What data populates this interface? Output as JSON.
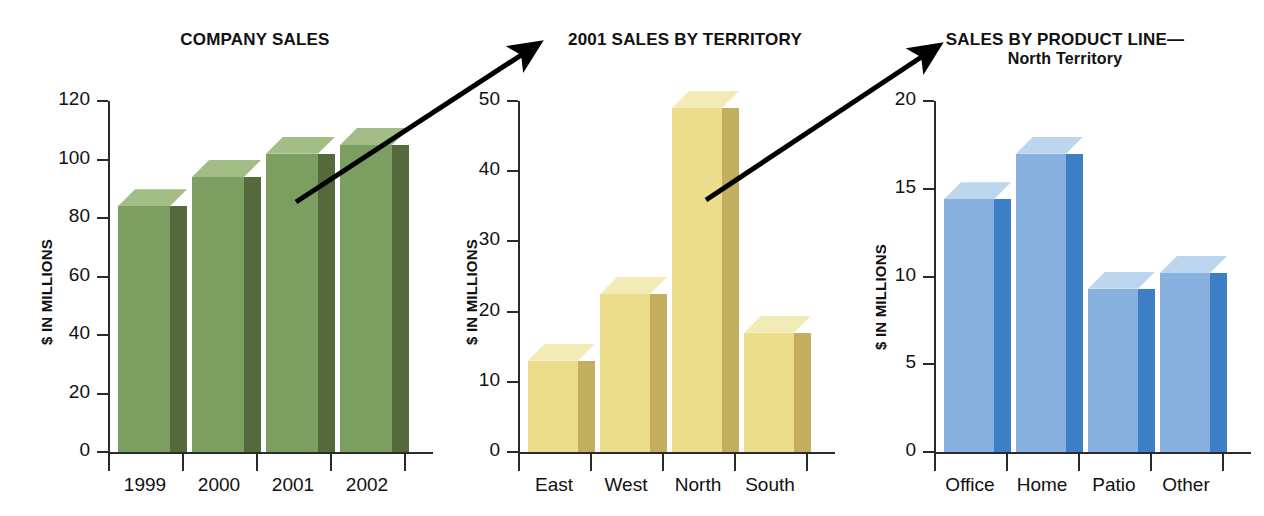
{
  "figure": {
    "background": "#ffffff",
    "arrows": [
      {
        "name": "arrow-company-to-territory",
        "x1": 296,
        "y1": 202,
        "x2": 532,
        "y2": 48
      },
      {
        "name": "arrow-territory-to-product",
        "x1": 706,
        "y1": 200,
        "x2": 932,
        "y2": 50
      }
    ]
  },
  "charts": [
    {
      "id": "company-sales",
      "title": "COMPANY SALES",
      "subtitle": "",
      "ylabel": "$ IN MILLIONS",
      "color_front": "#7d9e61",
      "color_side": "#56693d",
      "color_top": "#a2bd86",
      "chart_data": {
        "type": "bar",
        "title": "COMPANY SALES",
        "xlabel": "",
        "ylabel": "$ IN MILLIONS",
        "categories": [
          "1999",
          "2000",
          "2001",
          "2002"
        ],
        "values": [
          84,
          94,
          102,
          105
        ],
        "ylim": [
          0,
          120
        ],
        "yticks": [
          0,
          20,
          40,
          60,
          80,
          100,
          120
        ],
        "ytick_labels": [
          "0",
          "20",
          "40",
          "60",
          "80",
          "100",
          "120"
        ],
        "grid": false,
        "legend": "none"
      }
    },
    {
      "id": "sales-by-territory",
      "title": "2001 SALES BY TERRITORY",
      "subtitle": "",
      "ylabel": "$ IN MILLIONS",
      "color_front": "#ecdd8d",
      "color_side": "#c4ae60",
      "color_top": "#f3ebb6",
      "chart_data": {
        "type": "bar",
        "title": "2001 SALES BY TERRITORY",
        "xlabel": "",
        "ylabel": "$ IN MILLIONS",
        "categories": [
          "East",
          "West",
          "North",
          "South"
        ],
        "values": [
          13,
          22.5,
          49,
          17
        ],
        "ylim": [
          0,
          50
        ],
        "yticks": [
          0,
          10,
          20,
          30,
          40,
          50
        ],
        "ytick_labels": [
          "0",
          "10",
          "20",
          "30",
          "40",
          "50"
        ],
        "grid": false,
        "legend": "none"
      }
    },
    {
      "id": "sales-by-product-line",
      "title": "SALES BY PRODUCT LINE—",
      "subtitle": "North Territory",
      "ylabel": "$ IN MILLIONS",
      "color_front": "#89b1df",
      "color_side": "#3d7fc4",
      "color_top": "#bcd6ef",
      "chart_data": {
        "type": "bar",
        "title": "SALES BY PRODUCT LINE— North Territory",
        "xlabel": "",
        "ylabel": "$ IN MILLIONS",
        "categories": [
          "Office",
          "Home",
          "Patio",
          "Other"
        ],
        "values": [
          14.4,
          17,
          9.3,
          10.2
        ],
        "ylim": [
          0,
          20
        ],
        "yticks": [
          0,
          5,
          10,
          15,
          20
        ],
        "ytick_labels": [
          "0",
          "5",
          "10",
          "15",
          "20"
        ],
        "grid": false,
        "legend": "none"
      }
    }
  ]
}
